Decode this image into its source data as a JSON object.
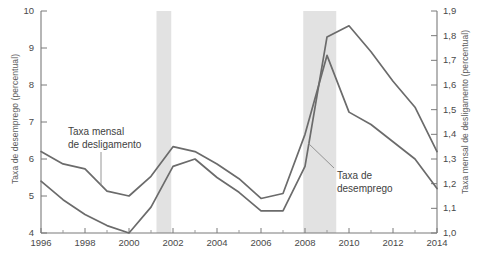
{
  "chart_data": {
    "type": "line",
    "title": "",
    "subtitle": "",
    "xlabel": "",
    "ylabel": "Taxa de desemprego (percentual)",
    "ylabel_right": "Taxa mensal de desligamento (percentual)",
    "xlim": [
      1996,
      2014
    ],
    "ylim": [
      4,
      10
    ],
    "ylim_right": [
      1.0,
      1.9
    ],
    "grid": false,
    "legend_position": "inline-annotations",
    "x": [
      1996,
      1997,
      1998,
      1999,
      2000,
      2001,
      2002,
      2003,
      2004,
      2005,
      2006,
      2007,
      2008,
      2009,
      2010,
      2011,
      2012,
      2013,
      2014
    ],
    "y_left_ticks": [
      "4",
      "5",
      "6",
      "7",
      "8",
      "9",
      "10"
    ],
    "y_right_ticks": [
      "1,0",
      "1,1",
      "1,2",
      "1,3",
      "1,4",
      "1,5",
      "1,6",
      "1,7",
      "1,8",
      "1,9"
    ],
    "x_ticks": [
      "1996",
      "1998",
      "2000",
      "2002",
      "2004",
      "2006",
      "2008",
      "2010",
      "2012",
      "2014"
    ],
    "x_minor_ticks": [
      1997,
      1999,
      2001,
      2003,
      2005,
      2007,
      2009,
      2011,
      2013
    ],
    "series": [
      {
        "name": "Taxa de desemprego",
        "axis": "left",
        "color": "#6b6b6b",
        "values": [
          5.4,
          4.9,
          4.5,
          4.2,
          4.0,
          4.7,
          5.8,
          6.0,
          5.5,
          5.1,
          4.6,
          4.6,
          5.8,
          9.3,
          9.6,
          8.9,
          8.1,
          7.4,
          6.2
        ]
      },
      {
        "name": "Taxa mensal de desligamento",
        "axis": "right",
        "color": "#6b6b6b",
        "values": [
          1.33,
          1.28,
          1.26,
          1.17,
          1.15,
          1.23,
          1.35,
          1.33,
          1.28,
          1.22,
          1.14,
          1.16,
          1.4,
          1.72,
          1.49,
          1.44,
          1.37,
          1.3,
          1.18
        ]
      }
    ],
    "shaded_bands": [
      {
        "name": "recession-2001",
        "start": 2001.25,
        "end": 2001.92,
        "color": "#e2e2e2"
      },
      {
        "name": "recession-2008",
        "start": 2007.92,
        "end": 2009.42,
        "color": "#e2e2e2"
      }
    ],
    "annotations": [
      {
        "name": "annotation-separation-rate",
        "line1": "Taxa mensal",
        "line2": "de desligamento",
        "text_x": 68,
        "text_y": 126,
        "leader": {
          "x1": 101,
          "y1": 152,
          "x2": 101,
          "y2": 186
        }
      },
      {
        "name": "annotation-unemployment-rate",
        "line1": "Taxa de",
        "line2": "desemprego",
        "text_x": 337,
        "text_y": 170,
        "leader": {
          "x1": 334,
          "y1": 168,
          "x2": 308,
          "y2": 143
        }
      }
    ]
  }
}
